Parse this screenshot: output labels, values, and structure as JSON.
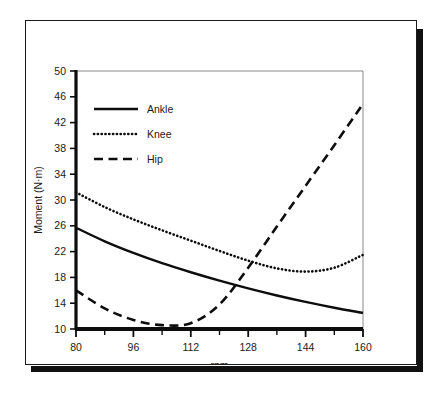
{
  "figure": {
    "frame_color": "#1a1a1a",
    "shadow_color": "#111111",
    "background": "#ffffff"
  },
  "chart_data": {
    "type": "line",
    "title": "",
    "subtitle": "",
    "xlabel": "rpm",
    "ylabel": "Moment (N·m)",
    "xlim": [
      80,
      160
    ],
    "ylim": [
      10,
      50
    ],
    "xticks": [
      80,
      96,
      112,
      128,
      144,
      160
    ],
    "xtick_labels": [
      "80",
      "96",
      "112",
      "128",
      "144",
      "160"
    ],
    "x_minor_tick_step": 8,
    "yticks": [
      10,
      14,
      18,
      22,
      26,
      30,
      34,
      38,
      42,
      46,
      50
    ],
    "ytick_labels": [
      "10",
      "14",
      "18",
      "22",
      "26",
      "30",
      "34",
      "38",
      "42",
      "46",
      "50"
    ],
    "grid": false,
    "legend_position": "upper-left",
    "x": [
      80,
      88,
      96,
      104,
      112,
      120,
      128,
      136,
      144,
      152,
      160
    ],
    "series": [
      {
        "name": "Ankle",
        "style": "solid",
        "color": "#0d0d0d",
        "values": [
          25.7,
          23.6,
          21.8,
          20.2,
          18.8,
          17.5,
          16.3,
          15.2,
          14.2,
          13.3,
          12.5
        ]
      },
      {
        "name": "Knee",
        "style": "dotted",
        "color": "#0d0d0d",
        "values": [
          31.2,
          28.9,
          27.0,
          25.3,
          23.7,
          22.1,
          20.6,
          19.4,
          18.9,
          19.5,
          21.5
        ]
      },
      {
        "name": "Hip",
        "style": "dashed",
        "color": "#0d0d0d",
        "values": [
          16.0,
          13.2,
          11.4,
          10.6,
          10.9,
          13.8,
          19.5,
          25.9,
          32.2,
          38.5,
          44.9
        ]
      }
    ],
    "annotations": []
  },
  "legend": {
    "items": [
      {
        "label": "Ankle",
        "style": "solid"
      },
      {
        "label": "Knee",
        "style": "dotted"
      },
      {
        "label": "Hip",
        "style": "dashed"
      }
    ]
  }
}
